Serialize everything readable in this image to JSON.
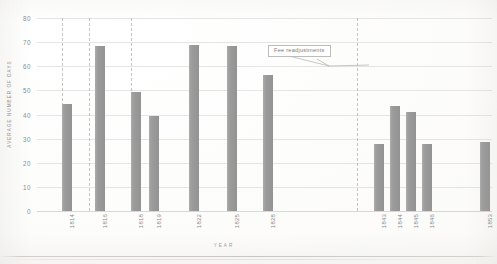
{
  "chart_data": {
    "type": "bar",
    "title": "",
    "subtitle": "",
    "xlabel": "YEAR",
    "ylabel": "AVERAGE NUMBER OF DAYS",
    "categories": [
      "1814",
      "1816",
      "1818",
      "1819",
      "1822",
      "1825",
      "1828",
      "1843",
      "1844",
      "1845",
      "1846",
      "1853"
    ],
    "values": [
      44.5,
      68.5,
      49.5,
      39.5,
      69,
      68.5,
      56.5,
      28,
      43.5,
      41,
      28,
      28.5
    ],
    "series": [
      {
        "name": "Average number of days",
        "values": [
          44.5,
          68.5,
          49.5,
          39.5,
          69,
          68.5,
          56.5,
          28,
          43.5,
          41,
          28,
          28.5
        ]
      }
    ],
    "ylim": [
      0,
      80
    ],
    "yticks": [
      0,
      10,
      20,
      30,
      40,
      50,
      60,
      70,
      80
    ],
    "ytick_labels": [
      "0",
      "10",
      "20",
      "30",
      "40",
      "50",
      "60",
      "70",
      "80"
    ],
    "grid": "horizontal",
    "legend": "none",
    "bar_color": "#9c9c9c",
    "gridline_color": "#c4c4c4",
    "annotations": [
      {
        "label": "Fee readjustments",
        "points_to_year": "1843"
      }
    ],
    "vertical_markers": [
      "1815",
      "1817",
      "1820",
      "1842"
    ]
  },
  "axes": {
    "y_title": "AVERAGE NUMBER OF DAYS",
    "x_title": "YEAR"
  },
  "annotation": {
    "text": "Fee readjustments"
  }
}
